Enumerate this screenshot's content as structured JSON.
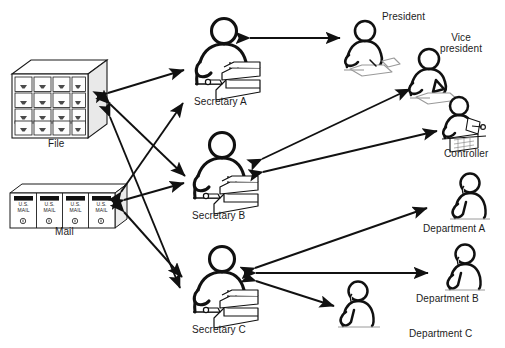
{
  "diagram": {
    "type": "node-link diagram",
    "background_color": "#ffffff",
    "line_color": "#111111",
    "nodes": [
      {
        "id": "file",
        "label": "File",
        "icon": "file-cabinet-icon",
        "label_x": 48,
        "label_y": 138,
        "x": 12,
        "y": 60,
        "w": 95,
        "h": 78
      },
      {
        "id": "mail",
        "label": "Mail",
        "icon": "mailboxes-icon",
        "label_x": 55,
        "label_y": 226,
        "x": 10,
        "y": 184,
        "w": 115,
        "h": 44
      },
      {
        "id": "secretary_a",
        "label": "Secretary A",
        "icon": "secretary-typing-icon",
        "label_x": 194,
        "label_y": 96,
        "x": 186,
        "y": 18,
        "w": 78,
        "h": 74
      },
      {
        "id": "secretary_b",
        "label": "Secretary B",
        "icon": "secretary-typing-icon",
        "label_x": 192,
        "label_y": 210,
        "x": 184,
        "y": 132,
        "w": 78,
        "h": 74
      },
      {
        "id": "secretary_c",
        "label": "Secretary C",
        "icon": "secretary-typing-icon",
        "label_x": 192,
        "label_y": 324,
        "x": 184,
        "y": 246,
        "w": 78,
        "h": 74
      },
      {
        "id": "president",
        "label": "President",
        "icon": "president-writing-icon",
        "label_x": 382,
        "label_y": 11,
        "x": 342,
        "y": 20,
        "w": 58,
        "h": 48
      },
      {
        "id": "vice_president",
        "label": "Vice\npresident",
        "icon": "vice-president-writing-icon",
        "label_x": 440,
        "label_y": 32,
        "x": 406,
        "y": 48,
        "w": 58,
        "h": 48
      },
      {
        "id": "controller",
        "label": "Controller",
        "icon": "controller-ledger-icon",
        "label_x": 444,
        "label_y": 148,
        "x": 438,
        "y": 96,
        "w": 54,
        "h": 50
      },
      {
        "id": "department_a",
        "label": "Department A",
        "icon": "department-phone-icon",
        "label_x": 423,
        "label_y": 223,
        "x": 448,
        "y": 172,
        "w": 44,
        "h": 48
      },
      {
        "id": "department_b",
        "label": "Department B",
        "icon": "department-phone-icon",
        "label_x": 416,
        "label_y": 293,
        "x": 443,
        "y": 243,
        "w": 44,
        "h": 48
      },
      {
        "id": "department_c",
        "label": "Department C",
        "icon": "department-phone-icon",
        "label_x": 409,
        "label_y": 328,
        "x": 336,
        "y": 280,
        "w": 44,
        "h": 46
      }
    ],
    "edges": [
      {
        "from": "secretary_a",
        "to": "file",
        "arrow": "both"
      },
      {
        "from": "secretary_b",
        "to": "file",
        "arrow": "both"
      },
      {
        "from": "secretary_c",
        "to": "file",
        "arrow": "both"
      },
      {
        "from": "secretary_b",
        "to": "mail",
        "arrow": "both"
      },
      {
        "from": "secretary_c",
        "to": "mail",
        "arrow": "both"
      },
      {
        "from": "secretary_a",
        "to": "mail",
        "arrow": "both"
      },
      {
        "from": "secretary_a",
        "to": "president",
        "arrow": "both"
      },
      {
        "from": "secretary_b",
        "to": "vice_president",
        "arrow": "both"
      },
      {
        "from": "secretary_b",
        "to": "controller",
        "arrow": "both"
      },
      {
        "from": "secretary_c",
        "to": "department_a",
        "arrow": "both"
      },
      {
        "from": "secretary_c",
        "to": "department_b",
        "arrow": "both"
      },
      {
        "from": "secretary_c",
        "to": "department_c",
        "arrow": "both"
      }
    ]
  },
  "mailbox": {
    "line1": "U.S.",
    "line2": "MAIL",
    "count": 4
  },
  "file_cabinet": {
    "rows": 4,
    "cols": 4
  }
}
